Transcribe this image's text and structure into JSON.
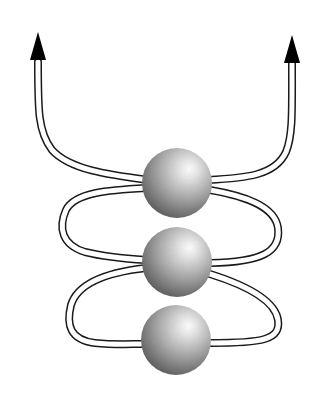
{
  "diagram": {
    "type": "schematic",
    "colors": {
      "background": "#ffffff",
      "tube_stroke": "#1a1a1a",
      "tube_fill": "#ffffff",
      "arrow": "#000000",
      "sphere_highlight": "#ffffff",
      "sphere_mid": "#b4b4b4",
      "sphere_shadow": "#5a5a5a"
    },
    "spheres": [
      {
        "id": "top",
        "cx": 177,
        "cy": 183,
        "r": 35
      },
      {
        "id": "middle",
        "cx": 177,
        "cy": 262,
        "r": 35
      },
      {
        "id": "bottom",
        "cx": 176,
        "cy": 340,
        "r": 35
      }
    ],
    "arrows": [
      {
        "id": "left",
        "x": 38,
        "tip_y": 32,
        "direction": "up"
      },
      {
        "id": "right",
        "x": 292,
        "tip_y": 35,
        "direction": "up"
      }
    ],
    "loops": [
      {
        "side": "left",
        "between": [
          "top",
          "middle"
        ]
      },
      {
        "side": "right",
        "between": [
          "top",
          "middle"
        ]
      },
      {
        "side": "left",
        "between": [
          "middle",
          "bottom"
        ]
      },
      {
        "side": "right",
        "between": [
          "middle",
          "bottom"
        ]
      }
    ]
  }
}
